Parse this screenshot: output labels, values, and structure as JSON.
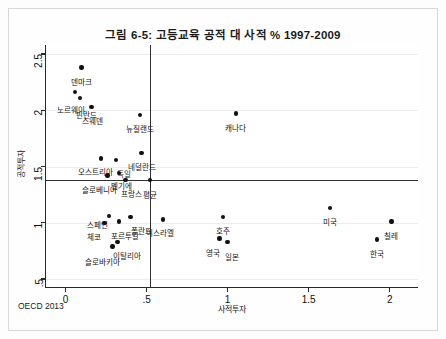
{
  "figure": {
    "title": "그림 6-5: 고등교육 공적 대 사적 % 1997-2009",
    "source": "OECD 2013"
  },
  "chart_data": {
    "type": "scatter",
    "title": "그림 6-5: 고등교육 공적 대 사적 % 1997-2009",
    "xlabel": "사적투자",
    "ylabel": "공적투자",
    "xlim": [
      -0.12,
      2.18
    ],
    "ylim": [
      0.42,
      2.58
    ],
    "xticks": [
      0,
      0.5,
      1,
      1.5,
      2
    ],
    "xticklabels": [
      "0",
      ".5",
      "1",
      "1.5",
      "2"
    ],
    "yticks": [
      0.5,
      1,
      1.5,
      2,
      2.5
    ],
    "yticklabels": [
      ".5",
      "1",
      "1.5",
      "2",
      "2.5"
    ],
    "grid": true,
    "legend": "none",
    "reference_lines": {
      "horizontal_y": 1.38,
      "vertical_x": 0.52
    },
    "points": [
      {
        "label": "덴마크",
        "x": 0.1,
        "y": 2.38,
        "label_dx": 0,
        "label_dy": 11
      },
      {
        "label": "노르웨이",
        "x": 0.06,
        "y": 2.16,
        "label_dx": -4,
        "label_dy": 15
      },
      {
        "label": "핀란드",
        "x": 0.09,
        "y": 2.11,
        "label_dx": 6,
        "label_dy": 14
      },
      {
        "label": "스웨덴",
        "x": 0.16,
        "y": 2.03,
        "label_dx": 1,
        "label_dy": 11
      },
      {
        "label": "뉴질랜드",
        "x": 0.46,
        "y": 1.96,
        "label_dx": 0,
        "label_dy": 11
      },
      {
        "label": "캐나다",
        "x": 1.05,
        "y": 1.97,
        "label_dx": 0,
        "label_dy": 11
      },
      {
        "label": "네덜란드",
        "x": 0.47,
        "y": 1.62,
        "label_dx": 0,
        "label_dy": 11
      },
      {
        "label": "오스트리아",
        "x": 0.22,
        "y": 1.57,
        "label_dx": -6,
        "label_dy": 10
      },
      {
        "label": "독일",
        "x": 0.31,
        "y": 1.56,
        "label_dx": 8,
        "label_dy": 11
      },
      {
        "label": "벨기에",
        "x": 0.33,
        "y": 1.44,
        "label_dx": 3,
        "label_dy": 10
      },
      {
        "label": "슬로베니아",
        "x": 0.26,
        "y": 1.42,
        "label_dx": -8,
        "label_dy": 11
      },
      {
        "label": "프랑스",
        "x": 0.37,
        "y": 1.38,
        "label_dx": 6,
        "label_dy": 11
      },
      {
        "label": "평균",
        "x": 0.52,
        "y": 1.38,
        "label_dx": 0,
        "label_dy": 12
      },
      {
        "label": "스페인",
        "x": 0.27,
        "y": 1.06,
        "label_dx": -12,
        "label_dy": 6
      },
      {
        "label": "체코",
        "x": 0.24,
        "y": 1.0,
        "label_dx": -10,
        "label_dy": 11
      },
      {
        "label": "포르투갈",
        "x": 0.33,
        "y": 1.01,
        "label_dx": 6,
        "label_dy": 11
      },
      {
        "label": "폴란드",
        "x": 0.4,
        "y": 1.05,
        "label_dx": 11,
        "label_dy": 11
      },
      {
        "label": "이스라엘",
        "x": 0.6,
        "y": 1.03,
        "label_dx": -3,
        "label_dy": 11
      },
      {
        "label": "호주",
        "x": 0.97,
        "y": 1.05,
        "label_dx": 0,
        "label_dy": 11
      },
      {
        "label": "미국",
        "x": 1.63,
        "y": 1.13,
        "label_dx": 0,
        "label_dy": 11
      },
      {
        "label": "칠레",
        "x": 2.01,
        "y": 1.01,
        "label_dx": 0,
        "label_dy": 11
      },
      {
        "label": "영국",
        "x": 0.95,
        "y": 0.86,
        "label_dx": -7,
        "label_dy": 11
      },
      {
        "label": "일본",
        "x": 1.0,
        "y": 0.83,
        "label_dx": 4,
        "label_dy": 12
      },
      {
        "label": "한국",
        "x": 1.92,
        "y": 0.85,
        "label_dx": 0,
        "label_dy": 11
      },
      {
        "label": "이탈리아",
        "x": 0.32,
        "y": 0.83,
        "label_dx": 10,
        "label_dy": 11
      },
      {
        "label": "슬로바키아",
        "x": 0.29,
        "y": 0.79,
        "label_dx": -10,
        "label_dy": 13
      }
    ]
  }
}
